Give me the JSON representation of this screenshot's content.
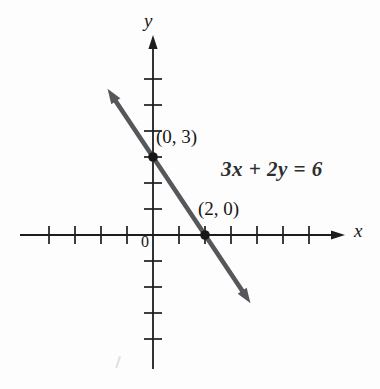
{
  "figure": {
    "background": "#fdfdfd",
    "axis_color": "#1d1d1d",
    "line_color": "#56575b",
    "point_color": "#171717",
    "text_color": "#171717"
  },
  "chart_data": {
    "type": "line",
    "title": "",
    "equation_label": "3x + 2y = 6",
    "xlabel": "x",
    "ylabel": "y",
    "origin_label": "0",
    "xlim": [
      -4,
      6
    ],
    "ylim": [
      -4,
      6
    ],
    "tick_step": 1,
    "grid": false,
    "line": {
      "slope": -1.5,
      "y_intercept": 3,
      "x_intercept": 2,
      "draw_extent_x": [
        -1.75,
        3.75
      ]
    },
    "points": [
      {
        "x": 0,
        "y": 3,
        "label": "(0, 3)"
      },
      {
        "x": 2,
        "y": 0,
        "label": "(2, 0)"
      }
    ],
    "plot_geometry": {
      "origin_px": [
        153,
        235
      ],
      "unit_px": 26,
      "x_axis_px": [
        20,
        345
      ],
      "y_axis_px": [
        35,
        369
      ]
    }
  }
}
